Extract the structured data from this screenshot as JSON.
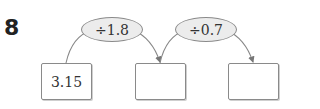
{
  "problem": {
    "number": "8",
    "operations": [
      {
        "label": "÷1.8"
      },
      {
        "label": "÷0.7"
      }
    ],
    "boxes": [
      {
        "value": "3.15"
      },
      {
        "value": ""
      },
      {
        "value": ""
      }
    ]
  }
}
